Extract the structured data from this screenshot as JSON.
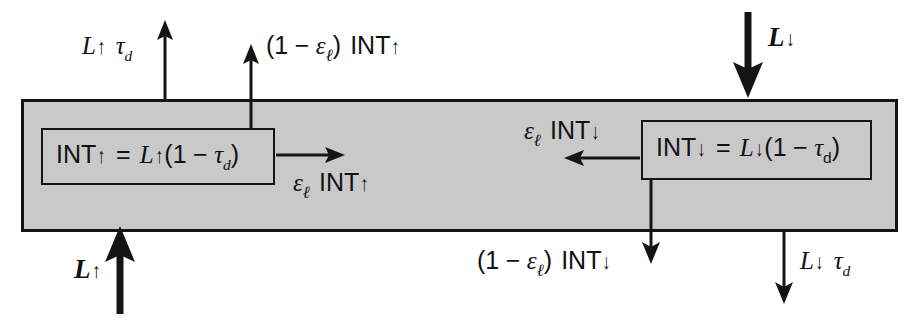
{
  "diagram": {
    "layer": {
      "fill_color": "#c9c9c9",
      "stroke_color": "#141414"
    },
    "labels": {
      "top_left_flux": "L↑ τd",
      "top_left_flux_parts": {
        "symbol": "L",
        "direction": "↑",
        "factor": "τ",
        "subscript": "d"
      },
      "top_mid_flux": "(1 − εℓ) INT↑",
      "inner_up_equation": "INT↑ = L↑(1 − τd)",
      "side_up_flux": "εℓ INT↑",
      "bottom_left_source": "L↑",
      "top_right_source": "L↓",
      "inner_dn_equation": "INT↓ = L↓(1 − τd)",
      "side_dn_flux": "εℓ INT↓",
      "bottom_mid_flux": "(1 − εℓ) INT↓",
      "bottom_right_flux": "L↓ τd"
    },
    "tokens": {
      "L": "L",
      "up": "↑",
      "down": "↓",
      "tau": "τ",
      "sub_d_italic": "d",
      "sub_d_roman": "d",
      "epsilon": "ε",
      "sub_l": "ℓ",
      "INT": "INT",
      "one": "1",
      "minus": "−",
      "equals": "=",
      "lparen": "(",
      "rparen": ")"
    },
    "arrows": [
      {
        "name": "arrow-up-left-transmitted",
        "from": [
          165,
          99
        ],
        "to": [
          165,
          24
        ],
        "style": "thin",
        "head": "up"
      },
      {
        "name": "arrow-up-mid-emitted",
        "from": [
          251,
          128
        ],
        "to": [
          251,
          47
        ],
        "style": "thin",
        "head": "up"
      },
      {
        "name": "arrow-right-absorbed-up",
        "from": [
          276,
          155
        ],
        "to": [
          344,
          155
        ],
        "style": "thin",
        "head": "right"
      },
      {
        "name": "arrow-up-bold-source",
        "from": [
          120,
          312
        ],
        "to": [
          120,
          228
        ],
        "style": "bold",
        "head": "up"
      },
      {
        "name": "arrow-down-bold-source",
        "from": [
          748,
          12
        ],
        "to": [
          748,
          95
        ],
        "style": "bold",
        "head": "down"
      },
      {
        "name": "arrow-left-absorbed-down",
        "from": [
          640,
          158
        ],
        "to": [
          566,
          158
        ],
        "style": "thin",
        "head": "left"
      },
      {
        "name": "arrow-down-mid-emitted",
        "from": [
          651,
          180
        ],
        "to": [
          651,
          262
        ],
        "style": "thin",
        "head": "down"
      },
      {
        "name": "arrow-down-right-transmitted",
        "from": [
          784,
          232
        ],
        "to": [
          784,
          300
        ],
        "style": "thin",
        "head": "down"
      }
    ]
  }
}
